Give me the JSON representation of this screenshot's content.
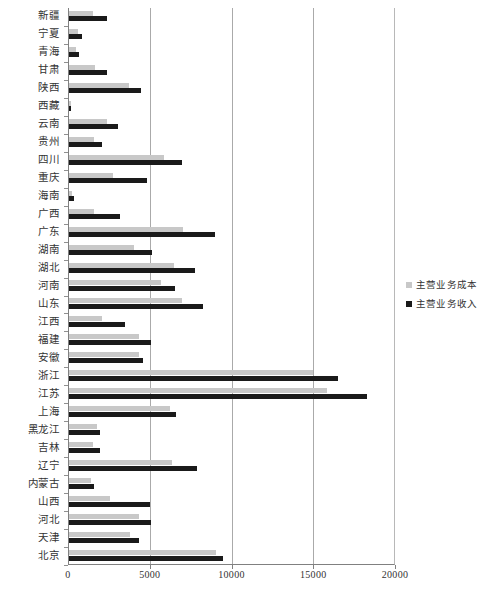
{
  "chart_data": {
    "type": "bar",
    "orientation": "horizontal",
    "title": "",
    "xlabel": "",
    "ylabel": "",
    "xlim": [
      0,
      20000
    ],
    "xticks": [
      0,
      5000,
      10000,
      15000,
      20000
    ],
    "xtick_labels": [
      "0",
      "5000",
      "10000",
      "15000",
      "20000"
    ],
    "grid": "vertical",
    "legend_position": "right",
    "categories": [
      "新疆",
      "宁夏",
      "青海",
      "甘肃",
      "陕西",
      "西藏",
      "云南",
      "贵州",
      "四川",
      "重庆",
      "海南",
      "广西",
      "广东",
      "湖南",
      "湖北",
      "河南",
      "山东",
      "江西",
      "福建",
      "安徽",
      "浙江",
      "江苏",
      "上海",
      "黑龙江",
      "吉林",
      "辽宁",
      "内蒙古",
      "山西",
      "河北",
      "天津",
      "北京"
    ],
    "series": [
      {
        "name": "主营业务成本",
        "color": "#c8c8c8",
        "values": [
          1450,
          520,
          400,
          1600,
          3650,
          120,
          2300,
          1500,
          5800,
          2700,
          210,
          1500,
          7000,
          4000,
          6450,
          5600,
          6900,
          2000,
          4300,
          4300,
          14950,
          15800,
          6200,
          1700,
          1450,
          6300,
          1350,
          2500,
          4300,
          3750,
          9000
        ],
        "unit": "万元"
      },
      {
        "name": "主营业务收入",
        "color": "#1a1a1a",
        "values": [
          2350,
          800,
          600,
          2350,
          4400,
          140,
          3000,
          2000,
          6900,
          4750,
          320,
          3100,
          8900,
          5100,
          7700,
          6500,
          8200,
          3450,
          5000,
          4500,
          16450,
          18200,
          6550,
          1900,
          1900,
          7850,
          1550,
          4950,
          5000,
          4300,
          9400
        ],
        "unit": "万元"
      }
    ]
  },
  "legend": {
    "items": [
      {
        "label": "主营业务成本",
        "color": "#c8c8c8"
      },
      {
        "label": "主营业务收入",
        "color": "#1a1a1a"
      }
    ]
  },
  "axis": {
    "x_tick_labels": [
      "0",
      "5000",
      "10000",
      "15000",
      "20000"
    ]
  }
}
